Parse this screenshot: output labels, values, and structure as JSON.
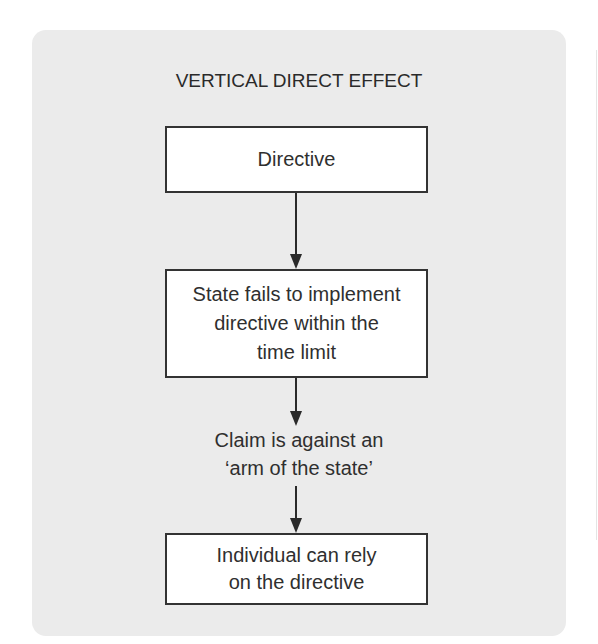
{
  "diagram": {
    "title": "VERTICAL DIRECT EFFECT",
    "colors": {
      "panel_background": "#ebebeb",
      "box_background": "#ffffff",
      "box_border": "#333333",
      "text": "#2a2a2a"
    },
    "steps": [
      {
        "type": "box",
        "lines": [
          "Directive"
        ]
      },
      {
        "type": "box",
        "lines": [
          "State fails to implement",
          "directive within the",
          "time limit"
        ]
      },
      {
        "type": "label",
        "lines": [
          "Claim is against an",
          "‘arm of the state’"
        ]
      },
      {
        "type": "box",
        "lines": [
          "Individual can rely",
          "on the directive"
        ]
      }
    ],
    "connectors": [
      {
        "from": 0,
        "to": 1,
        "icon": "arrow-down-icon"
      },
      {
        "from": 1,
        "to": 2,
        "icon": "arrow-down-icon"
      },
      {
        "from": 2,
        "to": 3,
        "icon": "arrow-down-icon"
      }
    ]
  }
}
